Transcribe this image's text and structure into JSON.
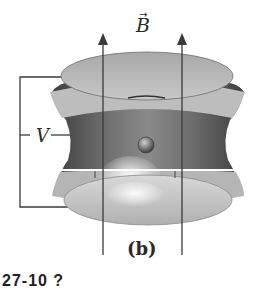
{
  "figure": {
    "field_label": "B",
    "field_vector_accent": "→",
    "voltage_label": "V",
    "panel_label": "(b)",
    "caption_fragment": "27-10 ?",
    "colors": {
      "background": "#ffffff",
      "line": "#3a3a3a",
      "cap_light": "#cfcfcf",
      "body_dark": "#5e5e5e",
      "ring_highlight": "#f4f4f4"
    },
    "components": {
      "top_electrode": "end cap",
      "ring_electrode": "hyperbolic ring",
      "bottom_electrode": "end cap",
      "trapped_particle": "sphere",
      "field_arrows": 2
    }
  }
}
